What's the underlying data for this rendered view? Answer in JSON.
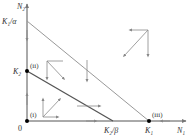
{
  "diagram": {
    "type": "phase-plane",
    "axes": {
      "x_label": "N₁",
      "y_label": "N₂",
      "origin_label": "0"
    },
    "y_ticks": [
      {
        "label": "K₁/α",
        "name": "k1-over-alpha"
      },
      {
        "label": "K₂",
        "name": "k2"
      }
    ],
    "x_ticks": [
      {
        "label": "K₂/β",
        "name": "k2-over-beta"
      },
      {
        "label": "K₁",
        "name": "k1"
      }
    ],
    "equilibria": [
      {
        "label": "(i)",
        "location": "origin"
      },
      {
        "label": "(ii)",
        "location": "K2 on N2 axis"
      },
      {
        "label": "(iii)",
        "location": "K1 on N1 axis"
      }
    ],
    "nullclines": [
      {
        "name": "N1-nullcline",
        "from": "K1/α",
        "to": "K1"
      },
      {
        "name": "N2-nullcline",
        "from": "K2",
        "to": "K2/β"
      }
    ],
    "colors": {
      "axis": "#555555",
      "line": "#777777",
      "arrow": "#888888",
      "point": "#000000"
    }
  }
}
